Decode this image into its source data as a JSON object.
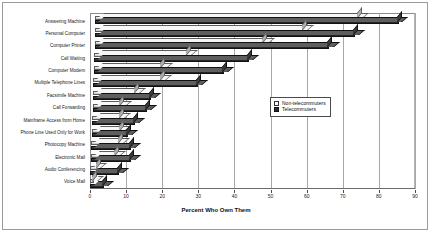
{
  "chart_data": {
    "type": "bar",
    "orientation": "horizontal",
    "title": "",
    "xlabel": "Percent Who Own Them",
    "ylabel": "",
    "xlim": [
      0,
      90
    ],
    "xticks": [
      0,
      10,
      20,
      30,
      40,
      50,
      60,
      70,
      80,
      90
    ],
    "grid": true,
    "legend_position": "center-right",
    "categories": [
      "Answering Machine",
      "Personal Computer",
      "Computer Printer",
      "Call Waiting",
      "Computer Modem",
      "Multiple Telephone Lines",
      "Facsimile Machine",
      "Call Forwarding",
      "Mainframe Access from Home",
      "Phone Line Used Only for Work",
      "Photocopy Machine",
      "Electronic Mail",
      "Audio Conferencing",
      "Voice Mail"
    ],
    "series": [
      {
        "name": "Non-telecommuters",
        "color": "#d8d8d8",
        "values": [
          73,
          58,
          47,
          26,
          19,
          19,
          12,
          8,
          8,
          8,
          8,
          7,
          2,
          1
        ]
      },
      {
        "name": "Telecommuters",
        "color": "#2e2e2e",
        "values": [
          84,
          72,
          65,
          43,
          36,
          29,
          16,
          15,
          12,
          10,
          11,
          11,
          8,
          4
        ]
      }
    ]
  },
  "legend": {
    "items": [
      {
        "label": "Non-telecommuters",
        "swatch": "light"
      },
      {
        "label": "Telecommuters",
        "swatch": "dark"
      }
    ]
  }
}
